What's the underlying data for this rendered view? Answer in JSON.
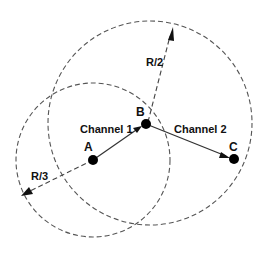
{
  "diagram": {
    "nodes": [
      {
        "id": "A",
        "label": "A",
        "x": 93,
        "y": 160
      },
      {
        "id": "B",
        "label": "B",
        "x": 146,
        "y": 124
      },
      {
        "id": "C",
        "label": "C",
        "x": 234,
        "y": 159
      }
    ],
    "links": [
      {
        "from": "A",
        "to": "B",
        "label": "Channel 1"
      },
      {
        "from": "B",
        "to": "C",
        "label": "Channel 2"
      }
    ],
    "ranges": [
      {
        "center": "A",
        "label": "R/3",
        "radius": 77
      },
      {
        "center": "B",
        "label": "R/2",
        "radius": 102
      }
    ]
  },
  "labels": {
    "node_a": "A",
    "node_b": "B",
    "node_c": "C",
    "channel_1": "Channel 1",
    "channel_2": "Channel 2",
    "radius_a": "R/3",
    "radius_b": "R/2"
  }
}
